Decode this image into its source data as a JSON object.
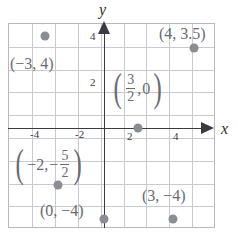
{
  "figure": {
    "type": "scatter",
    "axes": {
      "x_label": "x",
      "y_label": "y",
      "x_ticks": [
        "-4",
        "-2",
        "2",
        "4"
      ],
      "y_ticks": [
        "2",
        "4"
      ],
      "x_tick_values": [
        -4,
        -2,
        2,
        4
      ],
      "y_tick_values": [
        2,
        4
      ],
      "xlim": [
        -4.5,
        4.5
      ],
      "ylim": [
        -4.5,
        4.5
      ],
      "grid": true,
      "grid_step": 1
    },
    "points": [
      {
        "label": "(−3, 4)",
        "x": -3,
        "y": 4
      },
      {
        "label": "(4, 3.5)",
        "x": 4,
        "y": 3.5
      },
      {
        "label_kind": "fraction",
        "label_parts": {
          "open": "(",
          "num": "3",
          "den": "2",
          "sep": ",",
          "second": "0",
          "close": ")"
        },
        "x": 1.5,
        "y": 0
      },
      {
        "label_kind": "fraction",
        "label_parts": {
          "open": "(",
          "first": "−2,",
          "sign": "−",
          "num": "5",
          "den": "2",
          "close": ")"
        },
        "x": -2,
        "y": -2.5
      },
      {
        "label": "(0, −4)",
        "x": 0,
        "y": -4
      },
      {
        "label": "(3, −4)",
        "x": 3,
        "y": -4
      }
    ],
    "colors": {
      "point": "#8c8c93",
      "axis": "#3a3a40",
      "grid": "#c9c9d2",
      "text": "#6a6a72"
    }
  }
}
